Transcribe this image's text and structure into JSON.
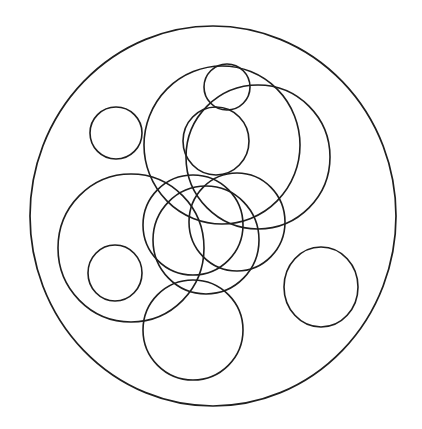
{
  "figure": {
    "canvas": {
      "width": 422,
      "height": 429
    },
    "background_color": "#ffffff",
    "stroke_color": "#1f1f1f",
    "stroke_width": 1.6,
    "fill": "none",
    "shape_type": "circle",
    "circle_count": 13
  },
  "chart_data": {
    "type": "scatter",
    "xlabel": "",
    "ylabel": "",
    "xlim": [
      0,
      422
    ],
    "ylim": [
      0,
      429
    ],
    "grid": false,
    "legend": "none",
    "circles": [
      {
        "name": "boundary-circle",
        "cx": 213,
        "cy": 216,
        "rx": 183,
        "ry": 190
      },
      {
        "name": "small-circle-upper-left",
        "cx": 116,
        "cy": 133,
        "rx": 26,
        "ry": 26
      },
      {
        "name": "small-circle-top",
        "cx": 227,
        "cy": 87,
        "rx": 23,
        "ry": 23
      },
      {
        "name": "large-circle-upper-left",
        "cx": 222,
        "cy": 145,
        "rx": 78,
        "ry": 79
      },
      {
        "name": "large-circle-upper-right",
        "cx": 258,
        "cy": 157,
        "rx": 72,
        "ry": 72
      },
      {
        "name": "medium-circle-upper-center",
        "cx": 216,
        "cy": 141,
        "rx": 33,
        "ry": 34
      },
      {
        "name": "large-circle-left",
        "cx": 131,
        "cy": 248,
        "rx": 73,
        "ry": 74
      },
      {
        "name": "small-circle-left-inner",
        "cx": 115,
        "cy": 273,
        "rx": 27,
        "ry": 28
      },
      {
        "name": "medium-circle-center-left",
        "cx": 193,
        "cy": 225,
        "rx": 50,
        "ry": 50
      },
      {
        "name": "medium-circle-center-right",
        "cx": 237,
        "cy": 222,
        "rx": 48,
        "ry": 49
      },
      {
        "name": "medium-circle-center-low",
        "cx": 206,
        "cy": 240,
        "rx": 53,
        "ry": 54
      },
      {
        "name": "large-circle-bottom",
        "cx": 193,
        "cy": 330,
        "rx": 50,
        "ry": 50
      },
      {
        "name": "small-circle-right",
        "cx": 321,
        "cy": 287,
        "rx": 37,
        "ry": 40
      }
    ]
  }
}
